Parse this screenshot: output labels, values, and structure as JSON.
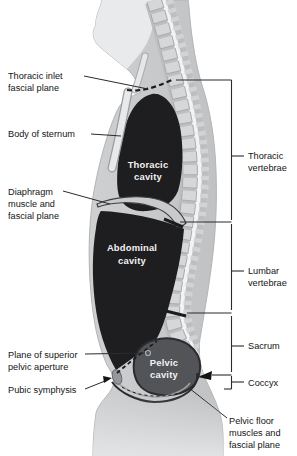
{
  "colors": {
    "background": "#ffffff",
    "body": "#c6c8ca",
    "head": "#e9eaeb",
    "bone": "#d6d7d8",
    "spinal_canal": "#f2f3f3",
    "cavity_dark": "#1e1e20",
    "pelvic_cavity": "#525457",
    "diaphragm_band": "#c8cacc",
    "sternum": "#e8e9ea",
    "line": "#2b2b2b",
    "text": "#141414",
    "cavity_text": "#f2f2f3"
  },
  "cavities": {
    "thoracic": {
      "line1": "Thoracic",
      "line2": "cavity"
    },
    "abdominal": {
      "line1": "Abdominal",
      "line2": "cavity"
    },
    "pelvic": {
      "line1": "Pelvic",
      "line2": "cavity"
    }
  },
  "left_labels": {
    "thoracic_inlet": {
      "line1": "Thoracic inlet",
      "line2": "fascial plane"
    },
    "sternum": {
      "line1": "Body of sternum"
    },
    "diaphragm": {
      "line1": "Diaphragm",
      "line2": "muscle and",
      "line3": "fascial plane"
    },
    "pelvic_aperture": {
      "line1": "Plane of superior",
      "line2": "pelvic aperture"
    },
    "pubic_symphysis": {
      "line1": "Pubic symphysis"
    }
  },
  "right_labels": {
    "thoracic_vertebrae": {
      "line1": "Thoracic",
      "line2": "vertebrae"
    },
    "lumbar_vertebrae": {
      "line1": "Lumbar",
      "line2": "vertebrae"
    },
    "sacrum": {
      "line1": "Sacrum"
    },
    "coccyx": {
      "line1": "Coccyx"
    },
    "pelvic_floor": {
      "line1": "Pelvic floor",
      "line2": "muscles and",
      "line3": "fascial plane"
    }
  }
}
